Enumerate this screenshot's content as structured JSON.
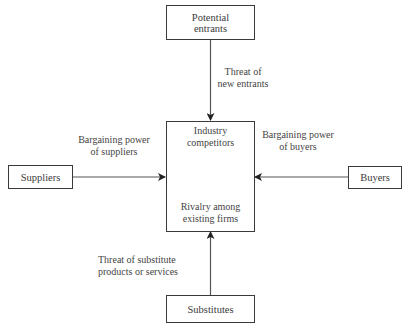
{
  "diagram": {
    "nodes": {
      "potential_entrants": {
        "line1": "Potential",
        "line2": "entrants"
      },
      "suppliers": {
        "label": "Suppliers"
      },
      "buyers": {
        "label": "Buyers"
      },
      "substitutes": {
        "label": "Substitutes"
      },
      "industry": {
        "top_line1": "Industry",
        "top_line2": "competitors",
        "bottom_line1": "Rivalry among",
        "bottom_line2": "existing firms"
      }
    },
    "edges": {
      "new_entrants": {
        "line1": "Threat of",
        "line2": "new entrants"
      },
      "suppliers_power": {
        "line1": "Bargaining power",
        "line2": "of suppliers"
      },
      "buyers_power": {
        "line1": "Bargaining power",
        "line2": "of buyers"
      },
      "substitutes_threat": {
        "line1": "Threat of substitute",
        "line2": "products or services"
      }
    },
    "colors": {
      "stroke": "#3a3a3a",
      "text": "#444444",
      "background": "#ffffff"
    }
  }
}
